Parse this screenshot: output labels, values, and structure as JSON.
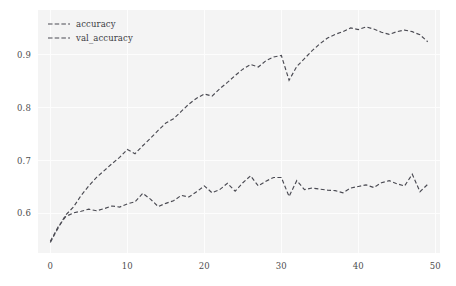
{
  "chart_data": {
    "type": "line",
    "title": "",
    "xlabel": "",
    "ylabel": "",
    "xlim": [
      -1.6,
      50.6
    ],
    "ylim": [
      0.525,
      0.985
    ],
    "grid": true,
    "legend_position": "upper left",
    "xticks": [
      0,
      10,
      20,
      30,
      40,
      50
    ],
    "xtick_labels": [
      "0",
      "10",
      "20",
      "30",
      "40",
      "50"
    ],
    "yticks": [
      0.6,
      0.7,
      0.8,
      0.9
    ],
    "ytick_labels": [
      "0.6",
      "0.7",
      "0.8",
      "0.9"
    ],
    "line_color": "#4a4a52",
    "line_style": "dashed",
    "background_color": "#f4f4f4",
    "x": [
      0,
      1,
      2,
      3,
      4,
      5,
      6,
      7,
      8,
      9,
      10,
      11,
      12,
      13,
      14,
      15,
      16,
      17,
      18,
      19,
      20,
      21,
      22,
      23,
      24,
      25,
      26,
      27,
      28,
      29,
      30,
      31,
      32,
      33,
      34,
      35,
      36,
      37,
      38,
      39,
      40,
      41,
      42,
      43,
      44,
      45,
      46,
      47,
      48,
      49
    ],
    "series": [
      {
        "name": "accuracy",
        "values": [
          0.545,
          0.572,
          0.597,
          0.612,
          0.634,
          0.652,
          0.668,
          0.681,
          0.694,
          0.706,
          0.721,
          0.713,
          0.728,
          0.742,
          0.757,
          0.771,
          0.779,
          0.793,
          0.807,
          0.818,
          0.826,
          0.822,
          0.836,
          0.848,
          0.861,
          0.873,
          0.882,
          0.877,
          0.889,
          0.896,
          0.899,
          0.852,
          0.878,
          0.893,
          0.908,
          0.921,
          0.932,
          0.939,
          0.944,
          0.951,
          0.948,
          0.953,
          0.949,
          0.943,
          0.939,
          0.944,
          0.947,
          0.944,
          0.938,
          0.925
        ]
      },
      {
        "name": "val_accuracy",
        "values": [
          0.547,
          0.574,
          0.594,
          0.601,
          0.604,
          0.608,
          0.605,
          0.609,
          0.614,
          0.612,
          0.618,
          0.622,
          0.638,
          0.627,
          0.613,
          0.619,
          0.624,
          0.634,
          0.631,
          0.641,
          0.652,
          0.639,
          0.645,
          0.657,
          0.642,
          0.658,
          0.671,
          0.652,
          0.661,
          0.668,
          0.668,
          0.632,
          0.662,
          0.645,
          0.648,
          0.646,
          0.644,
          0.643,
          0.639,
          0.648,
          0.651,
          0.654,
          0.649,
          0.658,
          0.662,
          0.656,
          0.652,
          0.674,
          0.641,
          0.655
        ]
      }
    ]
  },
  "legend": {
    "entries": [
      {
        "label": "accuracy"
      },
      {
        "label": "val_accuracy"
      }
    ]
  }
}
